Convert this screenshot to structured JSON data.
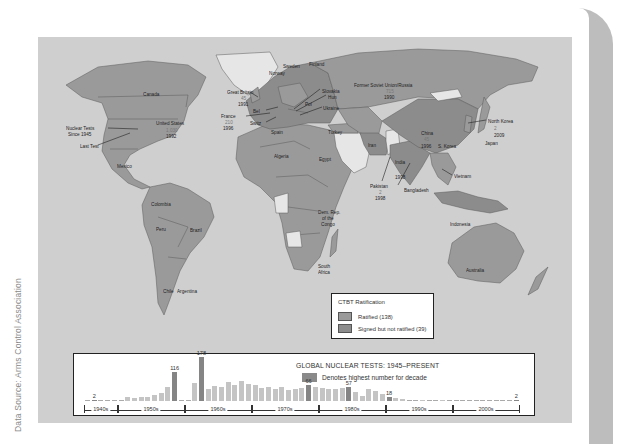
{
  "source_note": "Data Source: Arms Control Association",
  "map": {
    "colors": {
      "ocean": "#cfcfcf",
      "ratified": "#9a9a9a",
      "signed_not_ratified": "#8c8c8c",
      "not_signed": "#e6e6e6",
      "border": "#555555"
    },
    "labels": [
      {
        "text": "Canada",
        "x": 105,
        "y": 54
      },
      {
        "text": "United States",
        "x": 118,
        "y": 83
      },
      {
        "text": "1,030",
        "x": 128,
        "y": 90,
        "muted": true
      },
      {
        "text": "1992",
        "x": 128,
        "y": 96
      },
      {
        "text": "Nuclear Tests",
        "x": 28,
        "y": 88
      },
      {
        "text": "Since 1945",
        "x": 30,
        "y": 94
      },
      {
        "text": "Last Test",
        "x": 42,
        "y": 106
      },
      {
        "text": "Mexico",
        "x": 79,
        "y": 126
      },
      {
        "text": "Colombia",
        "x": 113,
        "y": 164
      },
      {
        "text": "Peru",
        "x": 118,
        "y": 189
      },
      {
        "text": "Brazil",
        "x": 152,
        "y": 190
      },
      {
        "text": "Chile",
        "x": 125,
        "y": 251
      },
      {
        "text": "Argentina",
        "x": 139,
        "y": 251
      },
      {
        "text": "Great Britain",
        "x": 189,
        "y": 52
      },
      {
        "text": "45",
        "x": 203,
        "y": 58,
        "muted": true
      },
      {
        "text": "1991",
        "x": 200,
        "y": 64
      },
      {
        "text": "Bel",
        "x": 215,
        "y": 71
      },
      {
        "text": "France",
        "x": 183,
        "y": 76
      },
      {
        "text": "210",
        "x": 187,
        "y": 82,
        "muted": true
      },
      {
        "text": "1996",
        "x": 185,
        "y": 88
      },
      {
        "text": "Switz",
        "x": 212,
        "y": 83
      },
      {
        "text": "Spain",
        "x": 233,
        "y": 92
      },
      {
        "text": "Norway",
        "x": 231,
        "y": 33
      },
      {
        "text": "Sweden",
        "x": 245,
        "y": 26
      },
      {
        "text": "Finland",
        "x": 271,
        "y": 24
      },
      {
        "text": "Slovakia",
        "x": 284,
        "y": 51
      },
      {
        "text": "Hun",
        "x": 290,
        "y": 57
      },
      {
        "text": "Pol",
        "x": 267,
        "y": 64
      },
      {
        "text": "Ukraine",
        "x": 285,
        "y": 68
      },
      {
        "text": "Turkey",
        "x": 290,
        "y": 92
      },
      {
        "text": "Algeria",
        "x": 236,
        "y": 116
      },
      {
        "text": "Egypt",
        "x": 281,
        "y": 119
      },
      {
        "text": "Dem. Rep.",
        "x": 280,
        "y": 172
      },
      {
        "text": "of the",
        "x": 284,
        "y": 178
      },
      {
        "text": "Congo",
        "x": 283,
        "y": 184
      },
      {
        "text": "South",
        "x": 280,
        "y": 226
      },
      {
        "text": "Africa",
        "x": 280,
        "y": 232
      },
      {
        "text": "Former Soviet Union/Russia",
        "x": 316,
        "y": 45
      },
      {
        "text": "715",
        "x": 348,
        "y": 51,
        "muted": true
      },
      {
        "text": "1990",
        "x": 346,
        "y": 57
      },
      {
        "text": "Iran",
        "x": 330,
        "y": 105
      },
      {
        "text": "India",
        "x": 357,
        "y": 122
      },
      {
        "text": "1998",
        "x": 357,
        "y": 137
      },
      {
        "text": "Pakistan",
        "x": 332,
        "y": 146
      },
      {
        "text": "2",
        "x": 341,
        "y": 152,
        "muted": true
      },
      {
        "text": "1998",
        "x": 337,
        "y": 158
      },
      {
        "text": "Bangladesh",
        "x": 366,
        "y": 150
      },
      {
        "text": "China",
        "x": 383,
        "y": 93
      },
      {
        "text": "45",
        "x": 386,
        "y": 99,
        "muted": true
      },
      {
        "text": "1996",
        "x": 383,
        "y": 106
      },
      {
        "text": "S. Korea",
        "x": 400,
        "y": 106
      },
      {
        "text": "North Korea",
        "x": 450,
        "y": 81
      },
      {
        "text": "2",
        "x": 456,
        "y": 88,
        "muted": true
      },
      {
        "text": "2009",
        "x": 456,
        "y": 95
      },
      {
        "text": "Japan",
        "x": 447,
        "y": 103
      },
      {
        "text": "Vietnam",
        "x": 416,
        "y": 136
      },
      {
        "text": "Indonesia",
        "x": 412,
        "y": 184
      },
      {
        "text": "Australia",
        "x": 428,
        "y": 230
      }
    ],
    "legend": {
      "title": "CTBT Ratification",
      "items": [
        {
          "label": "Ratified (138)",
          "color": "#9a9a9a"
        },
        {
          "label": "Signed but not ratified (39)",
          "color": "#8c8c8c"
        }
      ]
    }
  },
  "chart": {
    "title": "GLOBAL NUCLEAR TESTS: 1945–PRESENT",
    "key_label": "Denotes highest number for decade",
    "highlight_color": "#858585",
    "bar_color": "#c4c4c4",
    "decades": [
      {
        "label": "1940s",
        "start": 1945,
        "end": 1949
      },
      {
        "label": "1950s",
        "start": 1950,
        "end": 1959
      },
      {
        "label": "1960s",
        "start": 1960,
        "end": 1969
      },
      {
        "label": "1970s",
        "start": 1970,
        "end": 1979
      },
      {
        "label": "1980s",
        "start": 1980,
        "end": 1989
      },
      {
        "label": "1990s",
        "start": 1990,
        "end": 1999
      },
      {
        "label": "2000s",
        "start": 2000,
        "end": 2009
      }
    ]
  },
  "chart_data": {
    "type": "bar",
    "title": "GLOBAL NUCLEAR TESTS: 1945–PRESENT",
    "xlabel": "",
    "ylabel": "",
    "legend": [
      "Denotes highest number for decade"
    ],
    "grid": false,
    "categories": [
      1945,
      1946,
      1947,
      1948,
      1949,
      1950,
      1951,
      1952,
      1953,
      1954,
      1955,
      1956,
      1957,
      1958,
      1959,
      1960,
      1961,
      1962,
      1963,
      1964,
      1965,
      1966,
      1967,
      1968,
      1969,
      1970,
      1971,
      1972,
      1973,
      1974,
      1975,
      1976,
      1977,
      1978,
      1979,
      1980,
      1981,
      1982,
      1983,
      1984,
      1985,
      1986,
      1987,
      1988,
      1989,
      1990,
      1991,
      1992,
      1993,
      1994,
      1995,
      1996,
      1997,
      1998,
      1999,
      2000,
      2001,
      2002,
      2003,
      2004,
      2005,
      2006,
      2007,
      2008,
      2009
    ],
    "values": [
      1,
      2,
      0,
      3,
      1,
      0,
      18,
      11,
      18,
      16,
      24,
      33,
      55,
      116,
      0,
      3,
      71,
      178,
      50,
      60,
      58,
      76,
      64,
      79,
      67,
      64,
      53,
      57,
      48,
      57,
      45,
      50,
      54,
      66,
      58,
      54,
      50,
      49,
      54,
      57,
      36,
      22,
      47,
      40,
      27,
      18,
      14,
      8,
      1,
      2,
      5,
      3,
      0,
      5,
      0,
      0,
      0,
      0,
      0,
      0,
      0,
      1,
      0,
      0,
      2
    ],
    "decade_highs": [
      {
        "year": 1946,
        "value": 2,
        "label": "2"
      },
      {
        "year": 1958,
        "value": 116,
        "label": "116"
      },
      {
        "year": 1962,
        "value": 178,
        "label": "178"
      },
      {
        "year": 1978,
        "value": 66,
        "label": "66"
      },
      {
        "year": 1984,
        "value": 57,
        "label": "57"
      },
      {
        "year": 1990,
        "value": 18,
        "label": "18"
      },
      {
        "year": 2009,
        "value": 2,
        "label": "2"
      }
    ],
    "x_groups": [
      "1940s",
      "1950s",
      "1960s",
      "1970s",
      "1980s",
      "1990s",
      "2000s"
    ],
    "ylim": [
      0,
      180
    ]
  }
}
